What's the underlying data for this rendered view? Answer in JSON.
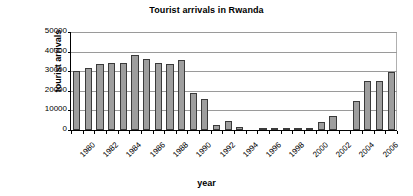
{
  "chart_data": {
    "type": "bar",
    "title": "Tourist arrivals in Rwanda",
    "xlabel": "year",
    "ylabel": "tourist arrivals",
    "ylim": [
      0,
      50000
    ],
    "y_ticks": [
      0,
      10000,
      20000,
      30000,
      40000,
      50000
    ],
    "y_tick_labels": [
      "0",
      "10000",
      "20000",
      "30000",
      "40000",
      "50000"
    ],
    "grid": true,
    "legend": "none",
    "x_tick_labels": [
      "1980",
      "1982",
      "1984",
      "1986",
      "1988",
      "1990",
      "1992",
      "1994",
      "1996",
      "1998",
      "2000",
      "2002",
      "2004",
      "2006"
    ],
    "categories": [
      "1980",
      "1981",
      "1982",
      "1983",
      "1984",
      "1985",
      "1986",
      "1987",
      "1988",
      "1989",
      "1990",
      "1991",
      "1992",
      "1993",
      "1994",
      "1995",
      "1996",
      "1997",
      "1998",
      "1999",
      "2000",
      "2001",
      "2002",
      "2003",
      "2004",
      "2005",
      "2006",
      "2007"
    ],
    "values": [
      30000,
      31800,
      33700,
      34400,
      34400,
      38500,
      36200,
      34400,
      33600,
      35500,
      19000,
      15600,
      2500,
      4600,
      1400,
      0,
      400,
      400,
      400,
      300,
      1000,
      4300,
      7000,
      0,
      15000,
      25100,
      25100,
      29600
    ],
    "series_name": "tourist arrivals",
    "bar_color": "#9e9e9e",
    "bar_border_color": "#3a3a3a",
    "axis_color": "#000000",
    "gridline_color": "#9a9a9a"
  }
}
